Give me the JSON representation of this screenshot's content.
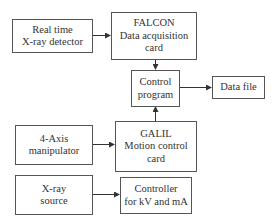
{
  "diagram": {
    "type": "block-diagram",
    "nodes": [
      {
        "id": "detector",
        "lines": [
          "Real time",
          "X-ray detector"
        ]
      },
      {
        "id": "falcon",
        "lines": [
          "FALCON",
          "Data acquisition",
          "card"
        ]
      },
      {
        "id": "control",
        "lines": [
          "Control",
          "program"
        ]
      },
      {
        "id": "datafile",
        "lines": [
          "Data file"
        ]
      },
      {
        "id": "manipulator",
        "lines": [
          "4-Axis",
          "manipulator"
        ]
      },
      {
        "id": "galil",
        "lines": [
          "GALIL",
          "Motion control",
          "card"
        ]
      },
      {
        "id": "xray",
        "lines": [
          "X-ray",
          "source"
        ]
      },
      {
        "id": "controller",
        "lines": [
          "Controller",
          "for kV and mA"
        ]
      }
    ],
    "edges": [
      {
        "from": "detector",
        "to": "falcon"
      },
      {
        "from": "falcon",
        "to": "control"
      },
      {
        "from": "control",
        "to": "datafile"
      },
      {
        "from": "galil",
        "to": "control"
      },
      {
        "from": "manipulator",
        "to": "galil"
      },
      {
        "from": "xray",
        "to": "controller"
      }
    ]
  }
}
